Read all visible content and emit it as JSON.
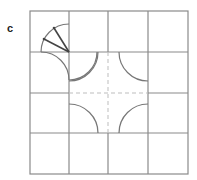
{
  "figure": {
    "panel_label": "c",
    "grid": {
      "rows": 4,
      "cols": 4
    },
    "colors": {
      "grid_line": "#8a8a8a",
      "dashed_line": "#bdbdbd",
      "arc": "#777777",
      "ray": "#444444"
    }
  }
}
